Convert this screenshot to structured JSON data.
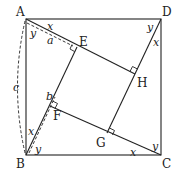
{
  "diagram": {
    "points": {
      "A": {
        "label": "A",
        "x": 26,
        "y": 19
      },
      "D": {
        "label": "D",
        "x": 161,
        "y": 19
      },
      "B": {
        "label": "B",
        "x": 26,
        "y": 155
      },
      "C": {
        "label": "C",
        "x": 161,
        "y": 155
      },
      "E": {
        "label": "E",
        "x": 77,
        "y": 47
      },
      "H": {
        "label": "H",
        "x": 135,
        "y": 74
      },
      "G": {
        "label": "G",
        "x": 107,
        "y": 133
      },
      "F": {
        "label": "F",
        "x": 50,
        "y": 106
      }
    },
    "angle_labels": {
      "A_x": "x",
      "A_y": "y",
      "D_y": "y",
      "D_x": "x",
      "C_y": "y",
      "C_x": "x",
      "B_x": "x",
      "B_y": "y"
    },
    "segment_labels": {
      "a": "a",
      "b": "b",
      "c": "c"
    },
    "colors": {
      "stroke": "#222222",
      "background": "#ffffff"
    }
  }
}
